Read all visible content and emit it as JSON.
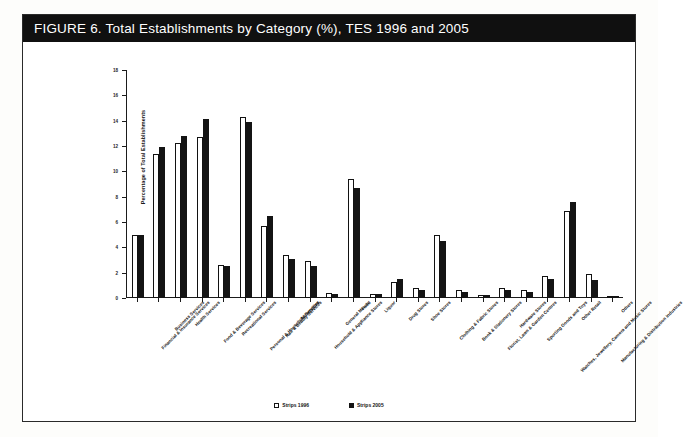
{
  "figure": {
    "title": "FIGURE 6. Total Establishments by Category (%), TES 1996 and 2005"
  },
  "legend": {
    "items": [
      {
        "label": "Strips 1996",
        "swatch": "hollow-square-icon",
        "color": "#ffffff"
      },
      {
        "label": "Strips 2005",
        "swatch": "filled-square-icon",
        "color": "#141414"
      }
    ]
  },
  "axes": {
    "y_title": "Percentage of Total Establishments",
    "y_ticks": [
      "0",
      "2",
      "4",
      "6",
      "8",
      "10",
      "12",
      "14",
      "16",
      "18"
    ]
  },
  "chart_data": {
    "type": "bar",
    "title": "FIGURE 6. Total Establishments by Category (%), TES 1996 and 2005",
    "xlabel": "",
    "ylabel": "Percentage of Total Establishments",
    "ylim": [
      0,
      18
    ],
    "ytick_step": 2,
    "grid": false,
    "legend_position": "bottom-center",
    "categories": [
      "Financial & Insurance Services",
      "Business Services",
      "Health Services",
      "Food & Beverage Services",
      "Recreational Services",
      "Personal & Household Services",
      "Hair & Beauty Services",
      "Automotive",
      "Household & Appliance Stores",
      "General Merch.",
      "Food",
      "Liquor",
      "Drug Stores",
      "Shoe Stores",
      "Clothing & Fabric Stores",
      "Book & Stationery Stores",
      "Florist, Lawn & Garden Centres",
      "Hardware Stores",
      "Sporting Goods and Toys",
      "Watches, Jewellery, Camera and Music Stores",
      "Other Retail",
      "Manufacturing & Distribution Industries",
      "Others"
    ],
    "series": [
      {
        "name": "Strips 1996",
        "values": [
          5.0,
          11.4,
          12.2,
          12.7,
          2.6,
          14.3,
          5.7,
          3.4,
          2.9,
          0.4,
          9.4,
          0.3,
          1.3,
          0.8,
          5.0,
          0.6,
          0.2,
          0.8,
          0.6,
          1.7,
          6.9,
          1.9,
          0.1
        ]
      },
      {
        "name": "Strips 2005",
        "values": [
          5.0,
          11.9,
          12.8,
          14.1,
          2.5,
          13.9,
          6.5,
          3.1,
          2.5,
          0.3,
          8.7,
          0.3,
          1.5,
          0.6,
          4.5,
          0.5,
          0.2,
          0.6,
          0.5,
          1.5,
          7.6,
          1.4,
          0.1
        ]
      }
    ]
  }
}
